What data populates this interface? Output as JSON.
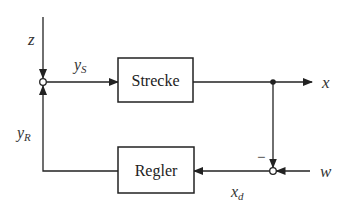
{
  "diagram": {
    "type": "control-loop-block-diagram",
    "blocks": [
      {
        "id": "strecke",
        "label": "Strecke"
      },
      {
        "id": "regler",
        "label": "Regler"
      }
    ],
    "signals": {
      "z": "z",
      "ys": "y",
      "ys_sub": "S",
      "x": "x",
      "w": "w",
      "xd": "x",
      "xd_sub": "d",
      "yr": "y",
      "yr_sub": "R"
    },
    "junctions": [
      {
        "id": "sum-left",
        "inputs": [
          "z",
          "yR"
        ],
        "output": "yS"
      },
      {
        "id": "sum-right",
        "inputs": [
          "w",
          "x"
        ],
        "signs": {
          "x": "−"
        },
        "output": "xd"
      }
    ],
    "minus_sign": "−",
    "colors": {
      "stroke": "#222222",
      "background": "#ffffff"
    }
  }
}
